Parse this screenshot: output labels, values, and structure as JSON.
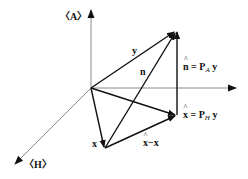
{
  "diagram": {
    "axes": {
      "A": {
        "label": "〈A〉"
      },
      "H": {
        "label": "〈H〉"
      }
    },
    "vectors": {
      "y": {
        "label": "y"
      },
      "n": {
        "label": "n"
      },
      "x": {
        "label": "x"
      },
      "n_hat": {
        "hat": "n",
        "eq": " = P",
        "sub": "A",
        "tail": " y"
      },
      "x_hat": {
        "hat": "x",
        "eq": " = P",
        "sub": "H",
        "tail": " y"
      },
      "x_hat_minus_x": {
        "hat": "x",
        "tail": "−x"
      }
    },
    "colors": {
      "axis": "#8a8a8a",
      "vector": "#111111",
      "background": "#ffffff"
    }
  }
}
